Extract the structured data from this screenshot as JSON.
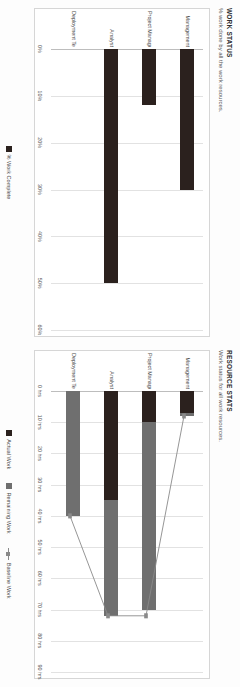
{
  "page": {
    "background": "#fdfdfd",
    "orientation": "rotated-90"
  },
  "colors": {
    "actual_work": "#2b211e",
    "remaining_work": "#6f6f6f",
    "baseline_work": "#8a8a8a",
    "pct_work_complete": "#2b211e",
    "gridline": "#e2e2e2",
    "frame": "#d6d6d6"
  },
  "work_status": {
    "title": "WORK STATUS",
    "subtitle": "% work done by all the work resources.",
    "legend": [
      {
        "label": "% Work Complete",
        "color": "#2b211e",
        "marker": "square"
      }
    ]
  },
  "resource_stats": {
    "title": "RESOURCE STATS",
    "subtitle": "Work status for all work resources.",
    "legend": [
      {
        "label": "Actual Work",
        "color": "#2b211e",
        "marker": "square"
      },
      {
        "label": "Remaining Work",
        "color": "#6f6f6f",
        "marker": "square"
      },
      {
        "label": "Baseline Work",
        "color": "#8a8a8a",
        "marker": "line"
      }
    ]
  },
  "chart_data": [
    {
      "type": "bar",
      "id": "work-status",
      "title": "WORK STATUS",
      "subtitle": "% work done by all the work resources.",
      "orientation": "vertical-rotated",
      "categories": [
        "Management",
        "Project Manager",
        "Analyst",
        "Deployment Team"
      ],
      "series": [
        {
          "name": "% Work Complete",
          "color": "#2b211e",
          "values": [
            30,
            12,
            50,
            0
          ]
        }
      ],
      "xlabel": "",
      "ylabel": "",
      "ylim": [
        0,
        60
      ],
      "yticks": [
        0,
        10,
        20,
        30,
        40,
        50,
        60
      ],
      "ytick_labels": [
        "0%",
        "10%",
        "20%",
        "30%",
        "40%",
        "50%",
        "60%"
      ],
      "grid": true,
      "legend_position": "bottom"
    },
    {
      "type": "bar",
      "id": "resource-stats",
      "title": "RESOURCE STATS",
      "subtitle": "Work status for all work resources.",
      "orientation": "vertical-rotated",
      "stacked": true,
      "categories": [
        "Management",
        "Project Manager",
        "Analyst",
        "Deployment Team"
      ],
      "series": [
        {
          "name": "Actual Work",
          "color": "#2b211e",
          "values": [
            7,
            10,
            35,
            0
          ]
        },
        {
          "name": "Remaining Work",
          "color": "#6f6f6f",
          "values": [
            1,
            60,
            37,
            40
          ]
        },
        {
          "name": "Baseline Work",
          "color": "#8a8a8a",
          "type": "line",
          "values": [
            8,
            72,
            72,
            40
          ]
        }
      ],
      "xlabel": "",
      "ylabel": "",
      "ylim": [
        0,
        90
      ],
      "yticks": [
        0,
        10,
        20,
        30,
        40,
        50,
        60,
        70,
        80,
        90
      ],
      "ytick_labels": [
        "0 hrs",
        "10 hrs",
        "20 hrs",
        "30 hrs",
        "40 hrs",
        "50 hrs",
        "60 hrs",
        "70 hrs",
        "80 hrs",
        "90 hrs"
      ],
      "grid": true,
      "legend_position": "bottom"
    }
  ]
}
